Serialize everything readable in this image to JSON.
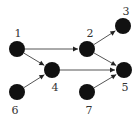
{
  "diagram": {
    "type": "directed-graph",
    "colors": {
      "background": "#ffffff",
      "node": "#111111",
      "edge": "#555555",
      "arrow": "#222222",
      "label": "#333333"
    },
    "node_radius": 8,
    "nodes": [
      {
        "id": "1",
        "label": "1",
        "x": 17,
        "y": 49,
        "lx": 18,
        "ly": 37
      },
      {
        "id": "2",
        "label": "2",
        "x": 87,
        "y": 49,
        "lx": 90,
        "ly": 37
      },
      {
        "id": "3",
        "label": "3",
        "x": 123,
        "y": 26,
        "lx": 126,
        "ly": 15
      },
      {
        "id": "4",
        "label": "4",
        "x": 52,
        "y": 70,
        "lx": 55,
        "ly": 91
      },
      {
        "id": "5",
        "label": "5",
        "x": 124,
        "y": 70,
        "lx": 125,
        "ly": 91
      },
      {
        "id": "6",
        "label": "6",
        "x": 17,
        "y": 92,
        "lx": 15,
        "ly": 114
      },
      {
        "id": "7",
        "label": "7",
        "x": 87,
        "y": 92,
        "lx": 89,
        "ly": 114
      }
    ],
    "edges": [
      {
        "from": "1",
        "to": "2"
      },
      {
        "from": "1",
        "to": "4"
      },
      {
        "from": "6",
        "to": "4"
      },
      {
        "from": "4",
        "to": "5"
      },
      {
        "from": "2",
        "to": "3"
      },
      {
        "from": "2",
        "to": "5"
      },
      {
        "from": "7",
        "to": "5"
      }
    ]
  }
}
